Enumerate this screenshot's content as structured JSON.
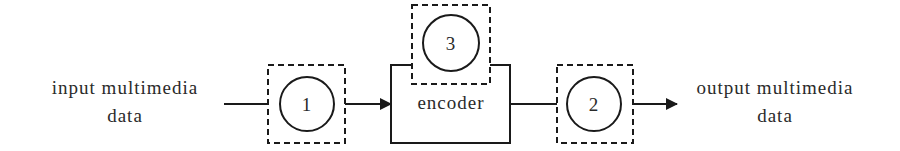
{
  "diagram": {
    "type": "block-flow",
    "input": {
      "line1": "input multimedia",
      "line2": "data"
    },
    "output": {
      "line1": "output multimedia",
      "line2": "data"
    },
    "encoder": {
      "label": "encoder"
    },
    "nodes": [
      {
        "id": "1",
        "label": "1",
        "position": "before-encoder"
      },
      {
        "id": "2",
        "label": "2",
        "position": "after-encoder"
      },
      {
        "id": "3",
        "label": "3",
        "position": "inside-encoder"
      }
    ],
    "edges": [
      {
        "from": "input",
        "to": "node-1",
        "arrow": false
      },
      {
        "from": "node-1",
        "to": "encoder",
        "arrow": true
      },
      {
        "from": "encoder",
        "to": "node-2",
        "arrow": false
      },
      {
        "from": "node-2",
        "to": "output",
        "arrow": true
      }
    ],
    "colors": {
      "stroke": "#1a1a1a",
      "text": "#2a2a2a",
      "background": "#ffffff"
    }
  }
}
